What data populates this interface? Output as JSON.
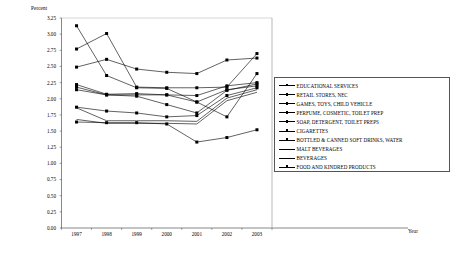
{
  "chart_data": {
    "type": "line",
    "title": "",
    "subtitle": "",
    "xlabel": "Year",
    "ylabel": "Percent",
    "grid": false,
    "legend_position": "right",
    "x": [
      1997,
      1998,
      1999,
      2000,
      2001,
      2002,
      2003
    ],
    "xtick_labels": [
      "1997",
      "1998",
      "1999",
      "2000",
      "2001",
      "2002",
      "2003"
    ],
    "ylim": [
      0.0,
      3.25
    ],
    "ytick_labels": [
      "0.00",
      "0.25",
      "0.50",
      "0.75",
      "1.00",
      "1.25",
      "1.50",
      "1.75",
      "2.00",
      "2.25",
      "2.50",
      "2.75",
      "3.00",
      "3.25"
    ],
    "ytick_values": [
      0.0,
      0.25,
      0.5,
      0.75,
      1.0,
      1.25,
      1.5,
      1.75,
      2.0,
      2.25,
      2.5,
      2.75,
      3.0,
      3.25
    ],
    "series": [
      {
        "name": "EDUCATIONAL SERVICES",
        "marker": "square",
        "values": [
          2.49,
          2.61,
          2.46,
          2.41,
          2.39,
          2.6,
          2.63
        ]
      },
      {
        "name": "RETAIL STORES, NEC",
        "marker": "square",
        "values": [
          2.77,
          3.01,
          2.18,
          2.17,
          2.17,
          2.18,
          2.7
        ]
      },
      {
        "name": "GAMES, TOYS, CHILD VEHICLE",
        "marker": "square",
        "values": [
          3.13,
          2.36,
          2.17,
          2.16,
          1.95,
          1.72,
          2.39
        ]
      },
      {
        "name": "PERFUME, COSMETIC, TOILET PREP",
        "marker": "square",
        "values": [
          2.22,
          2.07,
          2.08,
          2.06,
          2.05,
          2.2,
          2.25
        ]
      },
      {
        "name": "SOAP, DETERGENT, TOILET PREPS",
        "marker": "square",
        "values": [
          2.18,
          2.06,
          2.04,
          1.91,
          1.78,
          2.13,
          2.23
        ]
      },
      {
        "name": "CIGARETTES",
        "marker": "square",
        "values": [
          2.14,
          2.06,
          2.06,
          2.06,
          1.95,
          2.14,
          2.2
        ]
      },
      {
        "name": "BOTTLED & CANNED SOFT DRINKS, WATER",
        "marker": "square",
        "values": [
          1.87,
          1.81,
          1.78,
          1.72,
          1.74,
          2.05,
          2.17
        ]
      },
      {
        "name": "MALT BEVERAGES",
        "marker": "none",
        "values": [
          1.86,
          1.66,
          1.66,
          1.66,
          1.65,
          2.01,
          2.14
        ]
      },
      {
        "name": "BEVERAGES",
        "marker": "none",
        "values": [
          1.68,
          1.62,
          1.62,
          1.62,
          1.61,
          1.97,
          2.1
        ]
      },
      {
        "name": "FOOD AND KINDRED PRODUCTS",
        "marker": "square",
        "values": [
          1.64,
          1.63,
          1.63,
          1.61,
          1.33,
          1.4,
          1.52
        ]
      }
    ]
  },
  "colors": {
    "line": "#000000",
    "axis": "#555555",
    "background": "#ffffff"
  }
}
